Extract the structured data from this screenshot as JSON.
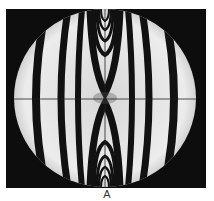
{
  "figure": {
    "background_color": "#0d0d0d",
    "disc_color": "#e6e6e6",
    "fringe_color": "#111111",
    "crosshair": true
  },
  "caption": {
    "label": "A"
  }
}
